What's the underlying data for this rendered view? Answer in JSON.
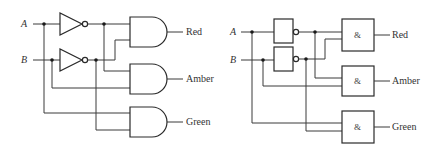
{
  "diagram": {
    "type": "logic-circuit",
    "inputs": [
      "A",
      "B"
    ],
    "outputs": [
      "Red",
      "Amber",
      "Green"
    ],
    "left_circuit": {
      "notation": "ANSI",
      "input_a": "A",
      "input_b": "B",
      "output_red": "Red",
      "output_amber": "Amber",
      "output_green": "Green",
      "gates": [
        {
          "id": "not_a",
          "type": "NOT",
          "input": "A"
        },
        {
          "id": "not_b",
          "type": "NOT",
          "input": "B"
        },
        {
          "id": "and_red",
          "type": "AND",
          "inputs": [
            "NOT A",
            "NOT B"
          ],
          "output": "Red"
        },
        {
          "id": "and_amber",
          "type": "AND",
          "inputs": [
            "NOT A",
            "B"
          ],
          "output": "Amber"
        },
        {
          "id": "and_green",
          "type": "AND",
          "inputs": [
            "A",
            "NOT B"
          ],
          "output": "Green"
        }
      ]
    },
    "right_circuit": {
      "notation": "IEC",
      "input_a": "A",
      "input_b": "B",
      "and_symbol": "&",
      "output_red": "Red",
      "output_amber": "Amber",
      "output_green": "Green"
    },
    "colors": {
      "line": "#3a3a3a",
      "text": "#333333",
      "background": "#ffffff"
    }
  }
}
